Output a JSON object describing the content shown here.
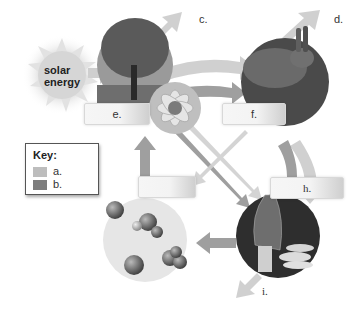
{
  "diagram": {
    "sun": {
      "label_line1": "solar",
      "label_line2": "energy"
    },
    "labels": {
      "c": "c.",
      "d": "d.",
      "e": "e.",
      "f": "f.",
      "g": "g.",
      "h": "h.",
      "i": "i."
    },
    "key": {
      "title": "Key:",
      "items": [
        {
          "label": "a.",
          "color": "#bdbdbd"
        },
        {
          "label": "b.",
          "color": "#7d7d7d"
        }
      ]
    },
    "nodes": [
      {
        "id": "producers",
        "depicts": "tree and flower"
      },
      {
        "id": "consumers",
        "depicts": "rabbit"
      },
      {
        "id": "decomposers",
        "depicts": "morel mushroom and larvae"
      },
      {
        "id": "nutrients",
        "depicts": "molecules"
      }
    ],
    "colors": {
      "arrow_light": "#c8c8c8",
      "arrow_dark": "#8a8a8a"
    }
  }
}
